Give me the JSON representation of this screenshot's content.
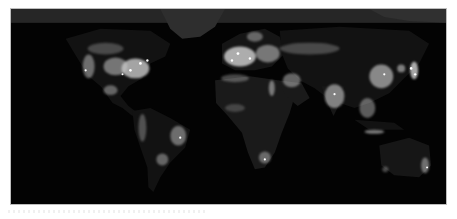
{
  "map": {
    "title": "Earth at night",
    "colors": {
      "ocean": "#030303",
      "arctic": "#2a2a2a",
      "land_dark": "#111111",
      "land_mid": "#1b1b1b",
      "lights": "#e8e8e8",
      "border": "#bdbdbd",
      "background": "#ffffff"
    },
    "regions": [
      {
        "name": "north-america",
        "brightness": "high"
      },
      {
        "name": "central-america",
        "brightness": "medium"
      },
      {
        "name": "south-america",
        "brightness": "medium"
      },
      {
        "name": "europe",
        "brightness": "high"
      },
      {
        "name": "africa",
        "brightness": "low"
      },
      {
        "name": "middle-east",
        "brightness": "medium"
      },
      {
        "name": "india",
        "brightness": "high"
      },
      {
        "name": "east-asia",
        "brightness": "high"
      },
      {
        "name": "japan",
        "brightness": "high"
      },
      {
        "name": "southeast-asia",
        "brightness": "medium"
      },
      {
        "name": "australia",
        "brightness": "low"
      },
      {
        "name": "greenland-arctic",
        "brightness": "none"
      }
    ]
  }
}
